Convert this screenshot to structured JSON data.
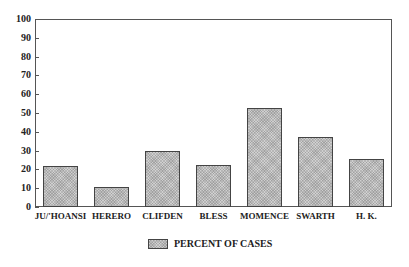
{
  "chart_data": {
    "type": "bar",
    "title": "",
    "xlabel": "",
    "ylabel": "",
    "categories": [
      "JU/'HOANSI",
      "HERERO",
      "CLIFDEN",
      "BLESS",
      "MOMENCE",
      "SWARTH",
      "H. K."
    ],
    "series": [
      {
        "name": "PERCENT OF CASES",
        "values": [
          22,
          10.5,
          30,
          22.5,
          52.5,
          37,
          25.5
        ]
      }
    ],
    "ylim": [
      0,
      100
    ],
    "yticks": [
      0,
      10,
      20,
      30,
      40,
      50,
      60,
      70,
      80,
      90,
      100
    ],
    "grid": false,
    "legend_position": "bottom-center"
  },
  "legend": {
    "label": "PERCENT OF CASES"
  },
  "colors": {
    "bar_fill": "#d0d0d0",
    "bar_border": "#444444",
    "axis": "#555555"
  }
}
